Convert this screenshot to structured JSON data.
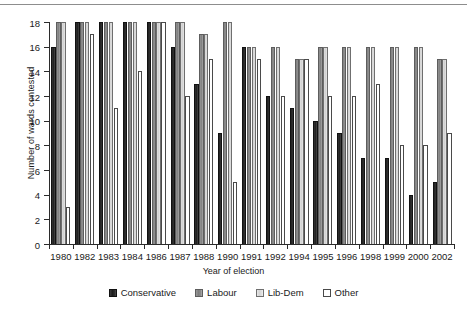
{
  "chart_data": {
    "type": "bar",
    "title": "",
    "xlabel": "Year of election",
    "ylabel": "Number of wards contested",
    "ylim": [
      0,
      18
    ],
    "yticks": [
      0,
      2,
      4,
      6,
      8,
      10,
      12,
      14,
      16,
      18
    ],
    "grid": false,
    "legend_position": "bottom",
    "categories": [
      "1980",
      "1982",
      "1983",
      "1984",
      "1986",
      "1987",
      "1988",
      "1990",
      "1991",
      "1992",
      "1994",
      "1995",
      "1996",
      "1998",
      "1999",
      "2000",
      "2002"
    ],
    "series": [
      {
        "name": "Conservative",
        "color": "#1c1c1c",
        "values": [
          16,
          18,
          18,
          18,
          18,
          16,
          13,
          9,
          16,
          12,
          11,
          10,
          9,
          7,
          7,
          4,
          5
        ]
      },
      {
        "name": "Labour",
        "color": "#8c8c8c",
        "values": [
          18,
          18,
          18,
          18,
          18,
          18,
          17,
          18,
          16,
          16,
          15,
          16,
          16,
          16,
          16,
          16,
          15
        ]
      },
      {
        "name": "Lib-Dem",
        "color": "#dcdcdc",
        "values": [
          18,
          18,
          18,
          18,
          18,
          18,
          17,
          18,
          16,
          16,
          15,
          16,
          16,
          16,
          16,
          16,
          15
        ]
      },
      {
        "name": "Other",
        "color": "#ffffff",
        "values": [
          3,
          17,
          11,
          14,
          18,
          12,
          15,
          5,
          15,
          12,
          15,
          12,
          12,
          13,
          8,
          8,
          9
        ]
      }
    ]
  }
}
